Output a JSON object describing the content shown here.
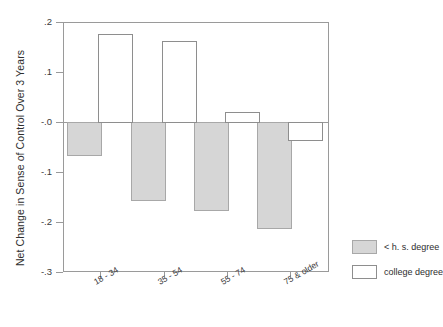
{
  "chart_data": {
    "type": "bar",
    "title": "",
    "xlabel": "",
    "ylabel": "Net Change in Sense of Control Over 3 Years",
    "categories": [
      "18 - 34",
      "35 - 54",
      "55 - 74",
      "75 & older"
    ],
    "series": [
      {
        "name": "< h. s. degree",
        "values": [
          -0.065,
          -0.156,
          -0.176,
          -0.212
        ],
        "color": "#d6d6d6"
      },
      {
        "name": "college degree",
        "values": [
          0.176,
          0.162,
          0.02,
          -0.036
        ],
        "color": "#ffffff"
      }
    ],
    "ylim": [
      -0.3,
      0.2
    ],
    "yticks": [
      ".2",
      ".1",
      "-.0",
      "-.1",
      "-.2",
      "-.3"
    ],
    "ytick_values": [
      0.2,
      0.1,
      0.0,
      -0.1,
      -0.2,
      -0.3
    ],
    "grid": false,
    "legend_position": "right-bottom"
  },
  "legend": {
    "items": [
      {
        "label": "< h. s. degree",
        "swatch": "gray-filled-square"
      },
      {
        "label": "college degree",
        "swatch": "white-outlined-square"
      }
    ]
  },
  "axes": {
    "y_title": "Net Change in Sense of Control Over 3 Years",
    "y_tick_labels": [
      ".2",
      ".1",
      "-.0",
      "-.1",
      "-.2",
      "-.3"
    ],
    "x_tick_labels": [
      "18 - 34",
      "35 - 54",
      "55 - 74",
      "75 & older"
    ]
  },
  "colors": {
    "low_degree_fill": "#d6d6d6",
    "low_degree_stroke": "#a8a8a8",
    "college_fill": "#ffffff",
    "college_stroke": "#8e8e8e",
    "axis": "#9a9a9a",
    "text": "#3a3a3a",
    "background": "#ffffff"
  }
}
